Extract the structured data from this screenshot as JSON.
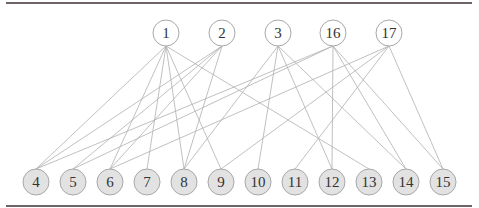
{
  "diagram": {
    "type": "bipartite-graph",
    "colors": {
      "rule": "#6e6468",
      "edge": "#b0b0b0",
      "top_fill": "#ffffff",
      "bottom_fill": "#e2e2e2",
      "node_stroke": "#a8a8a8",
      "label": "#333333"
    },
    "top_nodes": [
      {
        "id": "1",
        "x": 166,
        "y": 33
      },
      {
        "id": "2",
        "x": 222,
        "y": 33
      },
      {
        "id": "3",
        "x": 278,
        "y": 33
      },
      {
        "id": "16",
        "x": 333,
        "y": 33
      },
      {
        "id": "17",
        "x": 389,
        "y": 33
      }
    ],
    "bottom_nodes": [
      {
        "id": "4",
        "x": 36,
        "y": 182
      },
      {
        "id": "5",
        "x": 73,
        "y": 182
      },
      {
        "id": "6",
        "x": 110,
        "y": 182
      },
      {
        "id": "7",
        "x": 147,
        "y": 182
      },
      {
        "id": "8",
        "x": 184,
        "y": 182
      },
      {
        "id": "9",
        "x": 221,
        "y": 182
      },
      {
        "id": "10",
        "x": 258,
        "y": 182
      },
      {
        "id": "11",
        "x": 295,
        "y": 182
      },
      {
        "id": "12",
        "x": 332,
        "y": 182
      },
      {
        "id": "13",
        "x": 369,
        "y": 182
      },
      {
        "id": "14",
        "x": 406,
        "y": 182
      },
      {
        "id": "15",
        "x": 443,
        "y": 182
      }
    ],
    "edges": [
      [
        "1",
        "4"
      ],
      [
        "1",
        "6"
      ],
      [
        "1",
        "7"
      ],
      [
        "1",
        "8"
      ],
      [
        "1",
        "9"
      ],
      [
        "1",
        "13"
      ],
      [
        "2",
        "4"
      ],
      [
        "2",
        "5"
      ],
      [
        "2",
        "6"
      ],
      [
        "2",
        "8"
      ],
      [
        "3",
        "8"
      ],
      [
        "3",
        "10"
      ],
      [
        "3",
        "12"
      ],
      [
        "3",
        "14"
      ],
      [
        "16",
        "4"
      ],
      [
        "16",
        "5"
      ],
      [
        "16",
        "12"
      ],
      [
        "16",
        "14"
      ],
      [
        "16",
        "15"
      ],
      [
        "17",
        "6"
      ],
      [
        "17",
        "9"
      ],
      [
        "17",
        "11"
      ],
      [
        "17",
        "15"
      ]
    ]
  }
}
